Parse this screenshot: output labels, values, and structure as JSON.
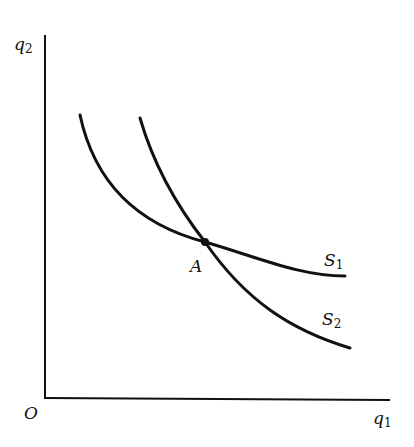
{
  "diagram": {
    "axes": {
      "origin_label": "O",
      "x_label": {
        "base": "q",
        "sub": "1"
      },
      "y_label": {
        "base": "q",
        "sub": "2"
      }
    },
    "curves": [
      {
        "name": "S1",
        "label": {
          "base": "S",
          "sub": "1"
        }
      },
      {
        "name": "S2",
        "label": {
          "base": "S",
          "sub": "2"
        }
      }
    ],
    "points": [
      {
        "name": "A",
        "label": "A"
      }
    ],
    "colors": {
      "ink": "#111111",
      "background": "#ffffff"
    }
  }
}
